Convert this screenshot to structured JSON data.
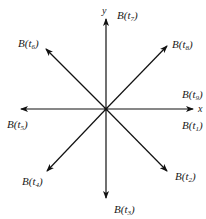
{
  "diagram": {
    "type": "vector-rotation",
    "axes": {
      "x_label": "x",
      "y_label": "y"
    },
    "origin": [
      106,
      109
    ],
    "vectors": [
      {
        "id": "t1",
        "label_base": "B(t",
        "subscript": "1",
        "label_close": ")",
        "direction": "east"
      },
      {
        "id": "t2",
        "label_base": "B(t",
        "subscript": "2",
        "label_close": ")",
        "direction": "south-east"
      },
      {
        "id": "t3",
        "label_base": "B(t",
        "subscript": "3",
        "label_close": ")",
        "direction": "south"
      },
      {
        "id": "t4",
        "label_base": "B(t",
        "subscript": "4",
        "label_close": ")",
        "direction": "south-west"
      },
      {
        "id": "t5",
        "label_base": "B(t",
        "subscript": "5",
        "label_close": ")",
        "direction": "west"
      },
      {
        "id": "t6",
        "label_base": "B(t",
        "subscript": "6",
        "label_close": ")",
        "direction": "north-west"
      },
      {
        "id": "t7",
        "label_base": "B(t",
        "subscript": "7",
        "label_close": ")",
        "direction": "north"
      },
      {
        "id": "t8",
        "label_base": "B(t",
        "subscript": "8",
        "label_close": ")",
        "direction": "north-east"
      },
      {
        "id": "t9",
        "label_base": "B(t",
        "subscript": "9",
        "label_close": ")",
        "direction": "east"
      }
    ],
    "colors": {
      "stroke": "#111111",
      "text": "#1a1a1a",
      "background": "#ffffff"
    }
  }
}
